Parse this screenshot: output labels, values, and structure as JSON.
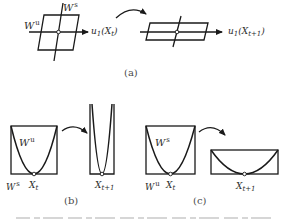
{
  "panel_a": {
    "caption": "(a)",
    "left": {
      "stable_label_base": "W",
      "stable_label_sup": "s",
      "unstable_label_base": "W",
      "unstable_label_sup": "u",
      "axis_label_base": "u",
      "axis_label_sub": "1",
      "axis_label_arg": "(X",
      "axis_label_arg_sub": "t",
      "axis_label_close": ")"
    },
    "right": {
      "axis_label_base": "u",
      "axis_label_sub": "1",
      "axis_label_arg": "(X",
      "axis_label_arg_sub": "t+1",
      "axis_label_close": ")"
    }
  },
  "panel_b": {
    "caption": "(b)",
    "left": {
      "curve_label_base": "W",
      "curve_label_sup": "u",
      "base_label_base": "W",
      "base_label_sup": "s",
      "point_label_base": "X",
      "point_label_sub": "t"
    },
    "right": {
      "point_label_base": "X",
      "point_label_sub": "t+1"
    }
  },
  "panel_c": {
    "caption": "(c)",
    "left": {
      "curve_label_base": "W",
      "curve_label_sup": "s",
      "base_label_base": "W",
      "base_label_sup": "u",
      "point_label_base": "X",
      "point_label_sub": "t"
    },
    "right": {
      "point_label_base": "X",
      "point_label_sub": "t+1"
    }
  },
  "colors": {
    "stroke": "#1a1a1a",
    "text": "#2b2b2b",
    "background": "#ffffff"
  }
}
